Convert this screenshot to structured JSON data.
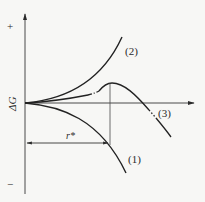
{
  "diagram": {
    "y_axis": {
      "label": "ΔG",
      "positive_sign": "+",
      "negative_sign": "−"
    },
    "x_axis": {
      "label": ""
    },
    "curves": [
      {
        "id": "1",
        "label": "(1)"
      },
      {
        "id": "2",
        "label": "(2)"
      },
      {
        "id": "3",
        "label": "(3)"
      }
    ],
    "critical_radius": {
      "label": "r*"
    },
    "colors": {
      "ink": "#2a2a2a",
      "background": "#f7f7f5"
    }
  }
}
